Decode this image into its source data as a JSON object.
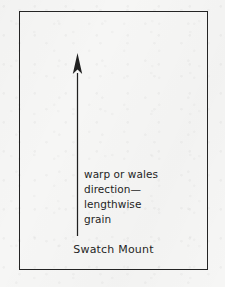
{
  "figure": {
    "kind": "textile-grain-direction-diagram",
    "caption": "Swatch Mount",
    "annotation": {
      "lines": [
        "warp or wales",
        "direction—",
        "lengthwise",
        "grain"
      ]
    },
    "arrow": {
      "icon": "up-arrow-icon",
      "direction": "up",
      "meaning": "lengthwise grain direction"
    },
    "colors": {
      "background": "#f6f6f5",
      "frame_border": "#242424",
      "ink": "#1f1f1f",
      "arrow": "#202020"
    }
  }
}
